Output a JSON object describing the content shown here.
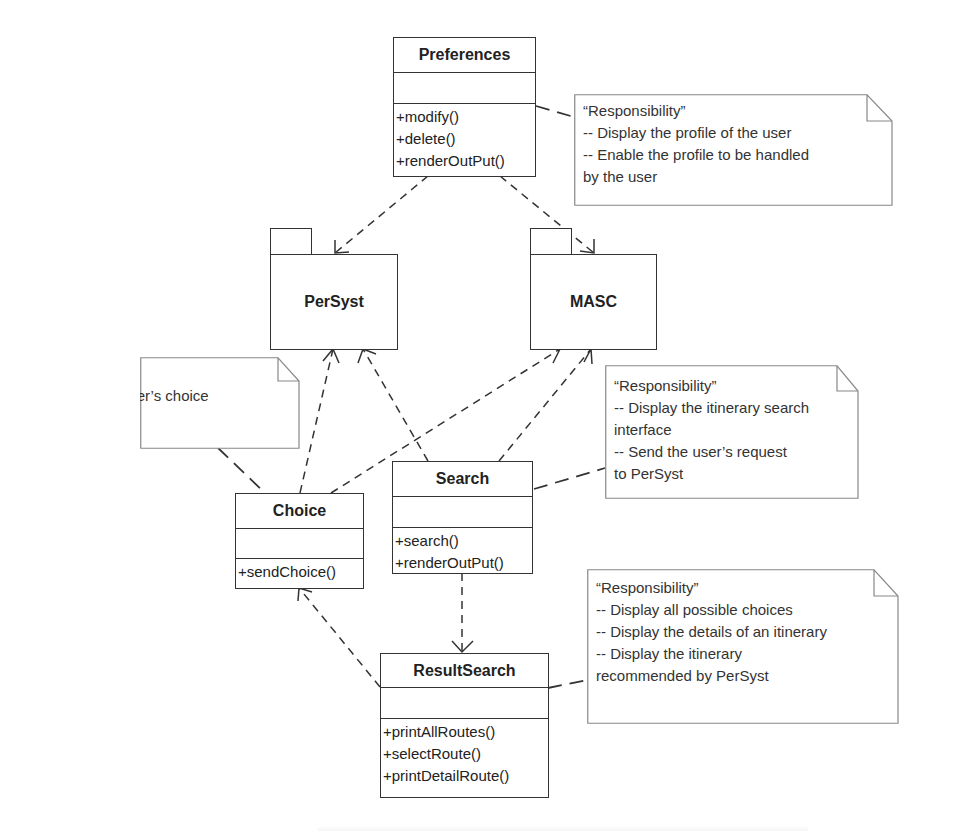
{
  "diagram": {
    "type": "UML class/package diagram",
    "classes": [
      {
        "id": "preferences",
        "name": "Preferences",
        "attributes": [],
        "operations": [
          "+modify()",
          "+delete()",
          "+renderOutPut()"
        ]
      },
      {
        "id": "choice",
        "name": "Choice",
        "attributes": [],
        "operations": [
          "+sendChoice()"
        ]
      },
      {
        "id": "search",
        "name": "Search",
        "attributes": [],
        "operations": [
          "+search()",
          "+renderOutPut()"
        ]
      },
      {
        "id": "resultsearch",
        "name": "ResultSearch",
        "attributes": [],
        "operations": [
          "+printAllRoutes()",
          "+selectRoute()",
          "+printDetailRoute()"
        ]
      }
    ],
    "packages": [
      {
        "id": "persyst",
        "name": "PerSyst"
      },
      {
        "id": "masc",
        "name": "MASC"
      }
    ],
    "notes": [
      {
        "id": "note-preferences",
        "attached_to": "Preferences",
        "lines": [
          "“Responsibility”",
          "-- Display the profile of the user",
          "-- Enable the profile to be handled",
          "by the user"
        ]
      },
      {
        "id": "note-choice",
        "attached_to": "Choice",
        "lines": [
          "“Responsibility”",
          "-- Transmit the user’s choice",
          "to PerSyst"
        ]
      },
      {
        "id": "note-search",
        "attached_to": "Search",
        "lines": [
          "“Responsibility”",
          "-- Display the itinerary search",
          "interface",
          "-- Send the user’s request",
          "to PerSyst"
        ]
      },
      {
        "id": "note-resultsearch",
        "attached_to": "ResultSearch",
        "lines": [
          "“Responsibility”",
          "-- Display all possible choices",
          "-- Display the details of an itinerary",
          "-- Display the itinerary",
          "recommended by PerSyst"
        ]
      }
    ],
    "dependencies": [
      {
        "from": "Preferences",
        "to": "PerSyst"
      },
      {
        "from": "Preferences",
        "to": "MASC"
      },
      {
        "from": "Choice",
        "to": "PerSyst"
      },
      {
        "from": "Choice",
        "to": "MASC"
      },
      {
        "from": "Search",
        "to": "PerSyst"
      },
      {
        "from": "Search",
        "to": "MASC"
      },
      {
        "from": "Search",
        "to": "ResultSearch"
      },
      {
        "from": "ResultSearch",
        "to": "Choice"
      }
    ]
  },
  "colors": {
    "line": "#333333",
    "note_border": "#888888",
    "background": "#ffffff"
  }
}
